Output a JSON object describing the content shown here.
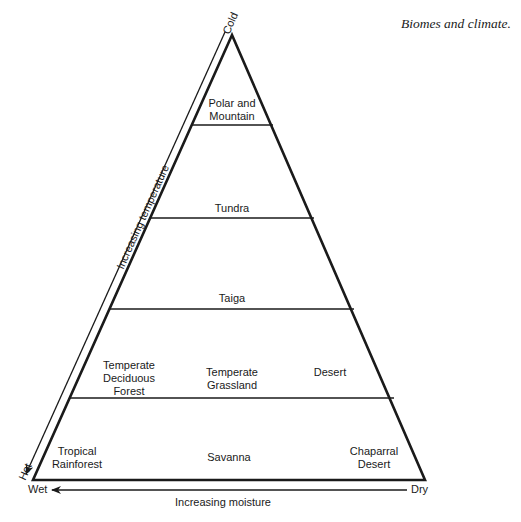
{
  "caption": "Biomes and climate.",
  "axes": {
    "temperature": {
      "label": "Increasing temperature",
      "start": "Cold",
      "end": "Hot"
    },
    "moisture": {
      "label": "Increasing moisture",
      "start": "Dry",
      "end": "Wet"
    }
  },
  "zones": [
    {
      "row": 1,
      "lines": [
        "Polar and",
        "Mountain"
      ]
    },
    {
      "row": 2,
      "lines": [
        "Tundra"
      ]
    },
    {
      "row": 3,
      "lines": [
        "Taiga"
      ]
    },
    {
      "row": 4,
      "lines": [
        "Temperate",
        "Deciduous",
        "Forest"
      ]
    },
    {
      "row": 4,
      "lines": [
        "Temperate",
        "Grassland"
      ]
    },
    {
      "row": 4,
      "lines": [
        "Desert"
      ]
    },
    {
      "row": 5,
      "lines": [
        "Tropical",
        "Rainforest"
      ]
    },
    {
      "row": 5,
      "lines": [
        "Savanna"
      ]
    },
    {
      "row": 5,
      "lines": [
        "Chaparral",
        "Desert"
      ]
    }
  ],
  "colors": {
    "line": "#1a1a1a",
    "background": "#ffffff"
  }
}
